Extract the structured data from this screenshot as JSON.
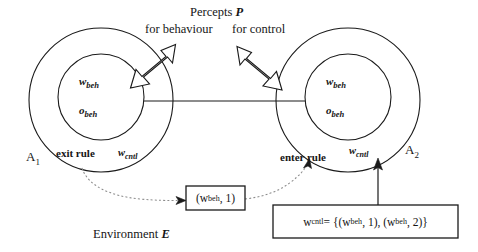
{
  "diagram": {
    "title_text": "Percepts",
    "title_var": "P",
    "label_for_behaviour": "for behaviour",
    "label_for_control": "for control",
    "environment_text": "Environment",
    "environment_var": "E",
    "agents": [
      {
        "name": "A",
        "index": "1",
        "inner_top": "w",
        "inner_top_sub": "beh",
        "inner_bottom": "o",
        "inner_bottom_sub": "beh",
        "ring_label": "w",
        "ring_label_sub": "cntl",
        "rule_label": "exit rule"
      },
      {
        "name": "A",
        "index": "2",
        "inner_top": "w",
        "inner_top_sub": "beh",
        "inner_bottom": "o",
        "inner_bottom_sub": "beh",
        "ring_label": "w",
        "ring_label_sub": "cntl",
        "rule_label": "enter rule"
      }
    ],
    "message_box": {
      "open_paren": "(w",
      "sub": "beh",
      "tail": ", 1)"
    },
    "cntl_box": {
      "lhs": "w",
      "lhs_sub": "cntl",
      "eq": " = {(w",
      "sub1": "beh",
      "mid": ", 1), (w",
      "sub2": "beh",
      "tail": ", 2)}"
    },
    "colors": {
      "stroke": "#1a1a1a",
      "dotted": "#8c8c8c",
      "background": "#ffffff",
      "text": "#161616"
    }
  }
}
